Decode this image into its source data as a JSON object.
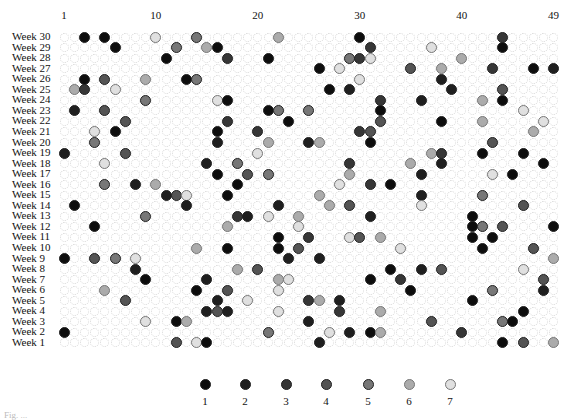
{
  "chart_data": {
    "type": "scatter",
    "title": "",
    "xlabel": "",
    "ylabel": "",
    "x_tick_labels": [
      {
        "col": 1,
        "label": "1"
      },
      {
        "col": 10,
        "label": "10"
      },
      {
        "col": 20,
        "label": "20"
      },
      {
        "col": 30,
        "label": "30"
      },
      {
        "col": 40,
        "label": "40"
      },
      {
        "col": 49,
        "label": "49"
      }
    ],
    "x_range": [
      1,
      49
    ],
    "rows": [
      "Week 30",
      "Week 29",
      "Week 28",
      "Week 27",
      "Week 26",
      "Week 25",
      "Week 24",
      "Week 23",
      "Week 22",
      "Week 21",
      "Week 20",
      "Week 19",
      "Week 18",
      "Week 17",
      "Week 16",
      "Week 15",
      "Week 14",
      "Week 13",
      "Week 12",
      "Week 11",
      "Week 10",
      "Week 9",
      "Week 8",
      "Week 7",
      "Week 6",
      "Week 5",
      "Week 4",
      "Week 3",
      "Week 2",
      "Week 1"
    ],
    "grid": "dotted circle per cell",
    "legend": {
      "position": "bottom",
      "entries": [
        {
          "label": "1",
          "color": "#0d0d0d"
        },
        {
          "label": "2",
          "color": "#1f1f1f"
        },
        {
          "label": "3",
          "color": "#363636"
        },
        {
          "label": "4",
          "color": "#545454"
        },
        {
          "label": "5",
          "color": "#777777"
        },
        {
          "label": "6",
          "color": "#ababab"
        },
        {
          "label": "7",
          "color": "#e0e0e0"
        }
      ]
    },
    "points_format": "per week: list of [number(column), draw-order level 1-7]",
    "points": {
      "Week 30": [
        [
          3,
          1
        ],
        [
          5,
          1
        ],
        [
          10,
          7
        ],
        [
          14,
          5
        ],
        [
          22,
          6
        ],
        [
          30,
          1
        ],
        [
          44,
          3
        ]
      ],
      "Week 29": [
        [
          6,
          1
        ],
        [
          12,
          5
        ],
        [
          15,
          6
        ],
        [
          16,
          1
        ],
        [
          31,
          3
        ],
        [
          37,
          7
        ],
        [
          44,
          1
        ]
      ],
      "Week 28": [
        [
          11,
          1
        ],
        [
          17,
          3
        ],
        [
          21,
          1
        ],
        [
          29,
          5
        ],
        [
          30,
          3
        ],
        [
          31,
          7
        ],
        [
          40,
          6
        ]
      ],
      "Week 27": [
        [
          26,
          1
        ],
        [
          28,
          7
        ],
        [
          35,
          4
        ],
        [
          38,
          6
        ],
        [
          43,
          3
        ],
        [
          47,
          1
        ],
        [
          49,
          2
        ]
      ],
      "Week 26": [
        [
          3,
          1
        ],
        [
          5,
          4
        ],
        [
          9,
          6
        ],
        [
          13,
          1
        ],
        [
          14,
          5
        ],
        [
          30,
          7
        ],
        [
          38,
          2
        ]
      ],
      "Week 25": [
        [
          2,
          6
        ],
        [
          3,
          3
        ],
        [
          6,
          7
        ],
        [
          27,
          1
        ],
        [
          29,
          2
        ],
        [
          39,
          2
        ],
        [
          44,
          4
        ]
      ],
      "Week 24": [
        [
          9,
          5
        ],
        [
          16,
          7
        ],
        [
          17,
          1
        ],
        [
          32,
          3
        ],
        [
          36,
          2
        ],
        [
          42,
          6
        ],
        [
          44,
          1
        ]
      ],
      "Week 23": [
        [
          2,
          2
        ],
        [
          5,
          4
        ],
        [
          21,
          1
        ],
        [
          22,
          5
        ],
        [
          25,
          5
        ],
        [
          32,
          1
        ],
        [
          46,
          7
        ]
      ],
      "Week 22": [
        [
          7,
          4
        ],
        [
          17,
          3
        ],
        [
          23,
          1
        ],
        [
          32,
          4
        ],
        [
          38,
          1
        ],
        [
          42,
          6
        ],
        [
          48,
          7
        ]
      ],
      "Week 21": [
        [
          4,
          7
        ],
        [
          6,
          1
        ],
        [
          16,
          1
        ],
        [
          20,
          3
        ],
        [
          30,
          3
        ],
        [
          31,
          4
        ],
        [
          47,
          6
        ]
      ],
      "Week 20": [
        [
          4,
          5
        ],
        [
          16,
          2
        ],
        [
          21,
          6
        ],
        [
          25,
          2
        ],
        [
          26,
          6
        ],
        [
          31,
          1
        ],
        [
          43,
          4
        ]
      ],
      "Week 19": [
        [
          1,
          2
        ],
        [
          7,
          4
        ],
        [
          20,
          7
        ],
        [
          37,
          6
        ],
        [
          38,
          3
        ],
        [
          42,
          1
        ],
        [
          46,
          1
        ]
      ],
      "Week 18": [
        [
          5,
          7
        ],
        [
          15,
          2
        ],
        [
          18,
          5
        ],
        [
          29,
          3
        ],
        [
          35,
          6
        ],
        [
          38,
          2
        ],
        [
          48,
          1
        ]
      ],
      "Week 17": [
        [
          16,
          1
        ],
        [
          19,
          4
        ],
        [
          21,
          5
        ],
        [
          29,
          6
        ],
        [
          36,
          2
        ],
        [
          43,
          7
        ],
        [
          45,
          1
        ]
      ],
      "Week 16": [
        [
          5,
          5
        ],
        [
          8,
          2
        ],
        [
          10,
          6
        ],
        [
          18,
          1
        ],
        [
          28,
          7
        ],
        [
          31,
          3
        ],
        [
          33,
          1
        ]
      ],
      "Week 15": [
        [
          11,
          2
        ],
        [
          12,
          4
        ],
        [
          13,
          7
        ],
        [
          17,
          1
        ],
        [
          26,
          6
        ],
        [
          36,
          2
        ],
        [
          42,
          5
        ]
      ],
      "Week 14": [
        [
          2,
          1
        ],
        [
          13,
          2
        ],
        [
          22,
          2
        ],
        [
          27,
          6
        ],
        [
          29,
          4
        ],
        [
          36,
          7
        ],
        [
          46,
          4
        ]
      ],
      "Week 13": [
        [
          9,
          5
        ],
        [
          18,
          3
        ],
        [
          19,
          2
        ],
        [
          21,
          7
        ],
        [
          24,
          6
        ],
        [
          31,
          2
        ],
        [
          41,
          1
        ]
      ],
      "Week 12": [
        [
          4,
          1
        ],
        [
          17,
          6
        ],
        [
          24,
          7
        ],
        [
          41,
          1
        ],
        [
          42,
          5
        ],
        [
          44,
          4
        ],
        [
          49,
          1
        ]
      ],
      "Week 11": [
        [
          22,
          1
        ],
        [
          25,
          3
        ],
        [
          29,
          7
        ],
        [
          30,
          4
        ],
        [
          32,
          6
        ],
        [
          41,
          1
        ],
        [
          43,
          1
        ]
      ],
      "Week 10": [
        [
          14,
          6
        ],
        [
          17,
          1
        ],
        [
          22,
          1
        ],
        [
          24,
          4
        ],
        [
          34,
          7
        ],
        [
          42,
          1
        ],
        [
          47,
          4
        ]
      ],
      "Week 9": [
        [
          1,
          1
        ],
        [
          4,
          4
        ],
        [
          6,
          5
        ],
        [
          8,
          7
        ],
        [
          23,
          2
        ],
        [
          26,
          2
        ],
        [
          49,
          6
        ]
      ],
      "Week 8": [
        [
          8,
          2
        ],
        [
          18,
          6
        ],
        [
          20,
          4
        ],
        [
          33,
          1
        ],
        [
          36,
          2
        ],
        [
          38,
          4
        ],
        [
          46,
          7
        ]
      ],
      "Week 7": [
        [
          9,
          1
        ],
        [
          15,
          2
        ],
        [
          22,
          6
        ],
        [
          23,
          7
        ],
        [
          31,
          1
        ],
        [
          34,
          3
        ],
        [
          48,
          4
        ]
      ],
      "Week 6": [
        [
          5,
          6
        ],
        [
          14,
          1
        ],
        [
          17,
          4
        ],
        [
          22,
          7
        ],
        [
          35,
          1
        ],
        [
          43,
          5
        ],
        [
          48,
          2
        ]
      ],
      "Week 5": [
        [
          7,
          4
        ],
        [
          16,
          2
        ],
        [
          19,
          7
        ],
        [
          25,
          3
        ],
        [
          26,
          6
        ],
        [
          28,
          2
        ],
        [
          41,
          1
        ]
      ],
      "Week 4": [
        [
          15,
          2
        ],
        [
          16,
          4
        ],
        [
          17,
          2
        ],
        [
          22,
          7
        ],
        [
          28,
          3
        ],
        [
          32,
          6
        ],
        [
          46,
          1
        ]
      ],
      "Week 3": [
        [
          9,
          7
        ],
        [
          12,
          1
        ],
        [
          13,
          6
        ],
        [
          25,
          2
        ],
        [
          37,
          4
        ],
        [
          44,
          5
        ],
        [
          45,
          1
        ]
      ],
      "Week 2": [
        [
          1,
          1
        ],
        [
          21,
          5
        ],
        [
          27,
          7
        ],
        [
          29,
          2
        ],
        [
          31,
          1
        ],
        [
          32,
          6
        ],
        [
          40,
          3
        ]
      ],
      "Week 1": [
        [
          12,
          4
        ],
        [
          14,
          7
        ],
        [
          15,
          1
        ],
        [
          26,
          2
        ],
        [
          44,
          1
        ],
        [
          46,
          4
        ],
        [
          49,
          6
        ]
      ]
    }
  },
  "caption": "Fig. ..."
}
